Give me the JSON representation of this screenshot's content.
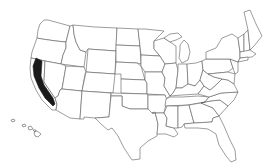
{
  "map": {
    "title": "United States",
    "highlighted_state": "California",
    "highlight_color": "#1a1a1a",
    "border_color": "#5a5a5a",
    "background": "#ffffff",
    "regions_shown": [
      "Contiguous United States",
      "Hawaii"
    ]
  }
}
